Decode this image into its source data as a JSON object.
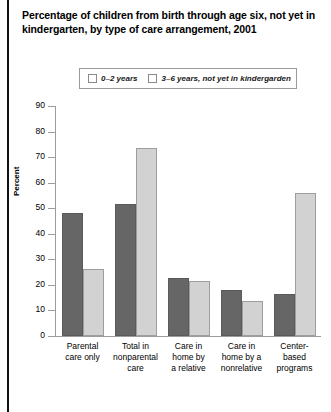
{
  "title": "Percentage of children from birth through age six, not yet in kindergarten, by type of care arrangement, 2001",
  "legend": {
    "items": [
      {
        "label": "0–2 years",
        "color": "#666666"
      },
      {
        "label": "3–6 years, not yet in kindergarden",
        "color": "#d2d2d2"
      }
    ]
  },
  "axes": {
    "ylabel": "Percent",
    "yticks": [
      "0",
      "10",
      "20",
      "30",
      "40",
      "50",
      "60",
      "70",
      "80",
      "90"
    ]
  },
  "chart_data": {
    "type": "bar",
    "title": "Percentage of children from birth through age six, not yet in kindergarten, by type of care arrangement, 2001",
    "xlabel": "",
    "ylabel": "Percent",
    "ylim": [
      0,
      90
    ],
    "ytick_step": 10,
    "grid": false,
    "legend_position": "top-center",
    "categories": [
      "Parental care only",
      "Total in nonparental care",
      "Care in home by a relative",
      "Care in home by a nonrelative",
      "Center-based programs"
    ],
    "category_lines": [
      [
        "Parental",
        "care only"
      ],
      [
        "Total in",
        "nonparental",
        "care"
      ],
      [
        "Care in",
        "home by",
        "a relative"
      ],
      [
        "Care in",
        "home by a",
        "nonrelative"
      ],
      [
        "Center-based",
        "programs"
      ]
    ],
    "series": [
      {
        "name": "0–2 years",
        "color": "#666666",
        "values": [
          48.3,
          51.6,
          22.8,
          17.9,
          16.3
        ]
      },
      {
        "name": "3–6 years, not yet in kindergarden",
        "color": "#d2d2d2",
        "values": [
          26.4,
          73.4,
          21.5,
          13.6,
          56.0
        ]
      }
    ]
  }
}
